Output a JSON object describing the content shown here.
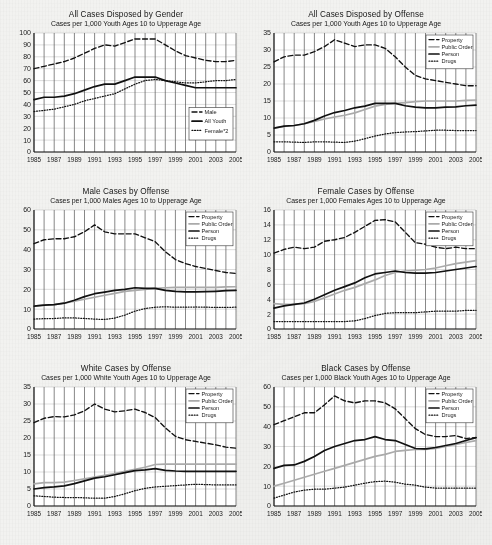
{
  "page": {
    "background_color": "#f2f2f0",
    "ink_color": "#1a1a1a",
    "grid_line_color": "#555555",
    "h_grid_color": "#b9b9b9",
    "public_order_color": "#aaaaaa"
  },
  "x_axis": {
    "tick_labels": [
      "1985",
      "1987",
      "1989",
      "1991",
      "1993",
      "1995",
      "1997",
      "1999",
      "2001",
      "2003",
      "2005"
    ],
    "years": [
      1985,
      1986,
      1987,
      1988,
      1989,
      1990,
      1991,
      1992,
      1993,
      1994,
      1995,
      1996,
      1997,
      1998,
      1999,
      2000,
      2001,
      2002,
      2003,
      2004,
      2005
    ],
    "min": 1985,
    "max": 2005
  },
  "charts": [
    {
      "id": "all-cases-by-gender",
      "chart_data": {
        "type": "line",
        "title": "All Cases Disposed by Gender",
        "subtitle": "Cases per 1,000 Youth Ages 10 to Upperage Age",
        "xlabel": "",
        "ylabel": "",
        "ylim": [
          0,
          100
        ],
        "yticks": [
          0,
          10,
          20,
          30,
          40,
          50,
          60,
          70,
          80,
          90,
          100
        ],
        "ytick_labels": [
          "0",
          "10",
          "20",
          "30",
          "40",
          "50",
          "60",
          "70",
          "80",
          "90",
          "100"
        ],
        "grid": true,
        "legend_position": "bottom-right",
        "x": [
          1985,
          1986,
          1987,
          1988,
          1989,
          1990,
          1991,
          1992,
          1993,
          1994,
          1995,
          1996,
          1997,
          1998,
          1999,
          2000,
          2001,
          2002,
          2003,
          2004,
          2005
        ],
        "series": [
          {
            "name": "Male",
            "style": "dashed",
            "color": "#111111",
            "values": [
              70,
              72,
              74,
              76,
              79,
              83,
              87,
              90,
              89,
              92,
              95,
              95,
              95,
              90,
              85,
              81,
              79,
              77,
              76,
              76,
              77
            ]
          },
          {
            "name": "All Youth",
            "style": "solid",
            "color": "#111111",
            "values": [
              44,
              46,
              46,
              47,
              49,
              52,
              55,
              57,
              57,
              60,
              63,
              63,
              63,
              60,
              58,
              56,
              54,
              54,
              54,
              54,
              54
            ]
          },
          {
            "name": "Female*2",
            "style": "dotted",
            "color": "#111111",
            "values": [
              34,
              35,
              36,
              38,
              40,
              43,
              45,
              47,
              49,
              53,
              57,
              60,
              61,
              60,
              59,
              58,
              58,
              59,
              60,
              60,
              61
            ]
          }
        ]
      }
    },
    {
      "id": "all-cases-by-offense",
      "chart_data": {
        "type": "line",
        "title": "All Cases Disposed by Offense",
        "subtitle": "Cases per 1,000 Youth Ages 10 to Upperage Age",
        "xlabel": "",
        "ylabel": "",
        "ylim": [
          0,
          35
        ],
        "yticks": [
          0,
          5,
          10,
          15,
          20,
          25,
          30,
          35
        ],
        "ytick_labels": [
          "0",
          "5",
          "10",
          "15",
          "20",
          "25",
          "30",
          "35"
        ],
        "grid": true,
        "legend_position": "top-right",
        "x": [
          1985,
          1986,
          1987,
          1988,
          1989,
          1990,
          1991,
          1992,
          1993,
          1994,
          1995,
          1996,
          1997,
          1998,
          1999,
          2000,
          2001,
          2002,
          2003,
          2004,
          2005
        ],
        "series": [
          {
            "name": "Property",
            "style": "dashed",
            "color": "#111111",
            "values": [
              26.5,
              28,
              28.5,
              28.5,
              29.5,
              31,
              33,
              32,
              31,
              31.5,
              31.5,
              30.5,
              28,
              25,
              22.5,
              21.5,
              21,
              20.5,
              20,
              19.5,
              19.5
            ]
          },
          {
            "name": "Public Order",
            "style": "solid",
            "color": "#aaaaaa",
            "values": [
              7,
              7.5,
              7.8,
              8.3,
              9,
              9.7,
              10.3,
              10.8,
              11.5,
              12.5,
              13.5,
              14,
              14.3,
              14.5,
              14.8,
              15,
              15,
              15,
              15,
              15.2,
              15.3
            ]
          },
          {
            "name": "Person",
            "style": "solid",
            "color": "#111111",
            "values": [
              7,
              7.6,
              7.8,
              8.3,
              9.3,
              10.6,
              11.6,
              12.2,
              13,
              13.5,
              14.3,
              14.3,
              14.3,
              13.6,
              13.2,
              13,
              13,
              13.2,
              13.3,
              13.6,
              13.8
            ]
          },
          {
            "name": "Drugs",
            "style": "dotted",
            "color": "#111111",
            "values": [
              3,
              3,
              2.9,
              2.8,
              3,
              3,
              2.9,
              2.8,
              3.2,
              3.9,
              4.7,
              5.3,
              5.7,
              5.9,
              6,
              6.2,
              6.4,
              6.4,
              6.3,
              6.3,
              6.3
            ]
          }
        ]
      }
    },
    {
      "id": "male-cases-by-offense",
      "chart_data": {
        "type": "line",
        "title": "Male Cases by Offense",
        "subtitle": "Cases per 1,000 Males Ages 10 to Upperage Age",
        "xlabel": "",
        "ylabel": "",
        "ylim": [
          0,
          60
        ],
        "yticks": [
          0,
          10,
          20,
          30,
          40,
          50,
          60
        ],
        "ytick_labels": [
          "0",
          "10",
          "20",
          "30",
          "40",
          "50",
          "60"
        ],
        "grid": true,
        "legend_position": "top-right",
        "x": [
          1985,
          1986,
          1987,
          1988,
          1989,
          1990,
          1991,
          1992,
          1993,
          1994,
          1995,
          1996,
          1997,
          1998,
          1999,
          2000,
          2001,
          2002,
          2003,
          2004,
          2005
        ],
        "series": [
          {
            "name": "Property",
            "style": "dashed",
            "color": "#111111",
            "values": [
              43,
              45,
              45.5,
              45.5,
              46.5,
              49,
              52.5,
              49,
              48,
              48,
              48,
              46,
              44,
              39,
              35,
              33,
              31.5,
              30.5,
              29.5,
              28.5,
              28
            ]
          },
          {
            "name": "Public Order",
            "style": "solid",
            "color": "#aaaaaa",
            "values": [
              11.5,
              12,
              12.3,
              13,
              14,
              15,
              16,
              17,
              18,
              19,
              19.5,
              20,
              20.5,
              20.8,
              21,
              21,
              21,
              21,
              21,
              21.2,
              21.3
            ]
          },
          {
            "name": "Person",
            "style": "solid",
            "color": "#111111",
            "values": [
              11.5,
              12,
              12.3,
              13,
              14.5,
              16.3,
              17.8,
              18.6,
              19.5,
              20,
              20.8,
              20.5,
              20.5,
              19.5,
              19,
              18.7,
              18.7,
              18.8,
              19,
              19.3,
              19.5
            ]
          },
          {
            "name": "Drugs",
            "style": "dotted",
            "color": "#111111",
            "values": [
              5,
              5.2,
              5.3,
              5.6,
              5.6,
              5.3,
              5,
              4.8,
              5.5,
              7,
              9,
              10.3,
              11,
              11.2,
              11,
              11,
              11.1,
              11,
              10.9,
              10.9,
              11
            ]
          }
        ]
      }
    },
    {
      "id": "female-cases-by-offense",
      "chart_data": {
        "type": "line",
        "title": "Female Cases by Offense",
        "subtitle": "Cases per 1,000 Females Ages 10 to Upperage Age",
        "xlabel": "",
        "ylabel": "",
        "ylim": [
          0,
          16
        ],
        "yticks": [
          0,
          2,
          4,
          6,
          8,
          10,
          12,
          14,
          16
        ],
        "ytick_labels": [
          "0",
          "2",
          "4",
          "6",
          "8",
          "10",
          "12",
          "14",
          "16"
        ],
        "grid": true,
        "legend_position": "top-right",
        "x": [
          1985,
          1986,
          1987,
          1988,
          1989,
          1990,
          1991,
          1992,
          1993,
          1994,
          1995,
          1996,
          1997,
          1998,
          1999,
          2000,
          2001,
          2002,
          2003,
          2004,
          2005
        ],
        "series": [
          {
            "name": "Property",
            "style": "dashed",
            "color": "#111111",
            "values": [
              10.2,
              10.7,
              11,
              10.8,
              11,
              11.8,
              12,
              12.3,
              13,
              13.8,
              14.6,
              14.7,
              14.4,
              13,
              11.6,
              11.4,
              11,
              10.8,
              11,
              10.8,
              10.8
            ]
          },
          {
            "name": "Public Order",
            "style": "solid",
            "color": "#aaaaaa",
            "values": [
              3.4,
              3.3,
              3.3,
              3.4,
              3.7,
              4.2,
              4.7,
              5.2,
              5.6,
              6.1,
              6.6,
              7.2,
              7.6,
              7.8,
              7.9,
              8,
              8.2,
              8.5,
              8.8,
              9,
              9.2
            ]
          },
          {
            "name": "Person",
            "style": "solid",
            "color": "#111111",
            "values": [
              2.8,
              3.1,
              3.3,
              3.5,
              4,
              4.6,
              5.2,
              5.7,
              6.2,
              6.9,
              7.4,
              7.6,
              7.8,
              7.6,
              7.5,
              7.5,
              7.6,
              7.8,
              8,
              8.2,
              8.4
            ]
          },
          {
            "name": "Drugs",
            "style": "dotted",
            "color": "#111111",
            "values": [
              1,
              1,
              1,
              1,
              1,
              1,
              1,
              1,
              1.1,
              1.4,
              1.8,
              2.1,
              2.2,
              2.2,
              2.2,
              2.3,
              2.4,
              2.4,
              2.4,
              2.5,
              2.5
            ]
          }
        ]
      }
    },
    {
      "id": "white-cases-by-offense",
      "chart_data": {
        "type": "line",
        "title": "White Cases by Offense",
        "subtitle": "Cases per 1,000 White Youth Ages 10 to Upperage Age",
        "xlabel": "",
        "ylabel": "",
        "ylim": [
          0,
          35
        ],
        "yticks": [
          0,
          5,
          10,
          15,
          20,
          25,
          30,
          35
        ],
        "ytick_labels": [
          "0",
          "5",
          "10",
          "15",
          "20",
          "25",
          "30",
          "35"
        ],
        "grid": true,
        "legend_position": "top-right",
        "x": [
          1985,
          1986,
          1987,
          1988,
          1989,
          1990,
          1991,
          1992,
          1993,
          1994,
          1995,
          1996,
          1997,
          1998,
          1999,
          2000,
          2001,
          2002,
          2003,
          2004,
          2005
        ],
        "series": [
          {
            "name": "Property",
            "style": "dashed",
            "color": "#111111",
            "values": [
              24.5,
              25.8,
              26.3,
              26.2,
              26.8,
              28,
              30,
              28.5,
              27.7,
              28,
              28.5,
              27.5,
              26,
              23,
              20.5,
              19.5,
              19,
              18.5,
              18,
              17.3,
              17
            ]
          },
          {
            "name": "Public Order",
            "style": "solid",
            "color": "#aaaaaa",
            "values": [
              6.5,
              6.9,
              6.9,
              7,
              7.5,
              8,
              8.5,
              9,
              9.5,
              10.2,
              10.8,
              11.4,
              12.2,
              12.3,
              12.3,
              12.3,
              12.3,
              12.3,
              12.3,
              12.3,
              12.3
            ]
          },
          {
            "name": "Person",
            "style": "solid",
            "color": "#111111",
            "values": [
              5,
              5.4,
              5.6,
              5.9,
              6.6,
              7.4,
              8.2,
              8.6,
              9.2,
              9.8,
              10.4,
              10.6,
              11,
              10.5,
              10.3,
              10.2,
              10.2,
              10.2,
              10.2,
              10.2,
              10.2
            ]
          },
          {
            "name": "Drugs",
            "style": "dotted",
            "color": "#111111",
            "values": [
              3,
              2.8,
              2.6,
              2.5,
              2.5,
              2.4,
              2.3,
              2.3,
              2.8,
              3.6,
              4.5,
              5.2,
              5.6,
              5.8,
              6,
              6.2,
              6.4,
              6.3,
              6.2,
              6.2,
              6.2
            ]
          }
        ]
      }
    },
    {
      "id": "black-cases-by-offense",
      "chart_data": {
        "type": "line",
        "title": "Black Cases by Offense",
        "subtitle": "Cases per 1,000 Black Youth Ages 10 to Upperage Age",
        "xlabel": "",
        "ylabel": "",
        "ylim": [
          0,
          60
        ],
        "yticks": [
          0,
          10,
          20,
          30,
          40,
          50,
          60
        ],
        "ytick_labels": [
          "0",
          "10",
          "20",
          "30",
          "40",
          "50",
          "60"
        ],
        "grid": true,
        "legend_position": "top-right",
        "x": [
          1985,
          1986,
          1987,
          1988,
          1989,
          1990,
          1991,
          1992,
          1993,
          1994,
          1995,
          1996,
          1997,
          1998,
          1999,
          2000,
          2001,
          2002,
          2003,
          2004,
          2005
        ],
        "series": [
          {
            "name": "Property",
            "style": "dashed",
            "color": "#111111",
            "values": [
              41,
              43,
              45,
              47,
              47,
              51,
              55.5,
              53,
              52,
              53,
              53,
              52,
              49,
              44,
              39,
              36,
              35,
              35,
              35.5,
              34,
              34.5
            ]
          },
          {
            "name": "Public Order",
            "style": "solid",
            "color": "#aaaaaa",
            "values": [
              10,
              11.5,
              13,
              14.5,
              16,
              17.5,
              19,
              20.5,
              22,
              23.5,
              25,
              26,
              27.5,
              28,
              28.5,
              28.5,
              29,
              30,
              31,
              32,
              33
            ]
          },
          {
            "name": "Person",
            "style": "solid",
            "color": "#111111",
            "values": [
              19,
              20.5,
              20.7,
              22.5,
              25,
              28,
              30,
              31.5,
              33,
              33.5,
              35,
              33.5,
              33,
              31,
              29,
              28.8,
              29.5,
              30.5,
              31.5,
              33,
              34.5
            ]
          },
          {
            "name": "Drugs",
            "style": "dotted",
            "color": "#111111",
            "values": [
              4,
              5.5,
              7,
              8,
              8.5,
              8.5,
              9,
              9.5,
              10.5,
              11.5,
              12.3,
              12.5,
              12,
              11,
              10.5,
              9.5,
              9,
              9,
              9,
              9,
              9
            ]
          }
        ]
      }
    }
  ]
}
